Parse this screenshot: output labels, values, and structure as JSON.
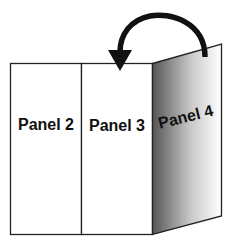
{
  "diagram": {
    "type": "folded-brochure",
    "panels": [
      {
        "id": "panel-2",
        "label": "Panel 2"
      },
      {
        "id": "panel-3",
        "label": "Panel 3"
      },
      {
        "id": "panel-4",
        "label": "Panel 4"
      }
    ],
    "arrow": {
      "direction": "fold-left",
      "meaning": "Panel 4 folds over onto Panel 3"
    },
    "colors": {
      "outline": "#222222",
      "shade_dark": "#555555",
      "shade_light": "#ffffff",
      "arrow": "#111111"
    }
  }
}
